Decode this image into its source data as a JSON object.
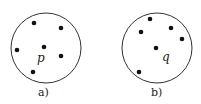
{
  "panels": [
    {
      "caption": "a)",
      "point_label": "p",
      "circle": {
        "cx": 46,
        "cy": 48,
        "r": 35
      },
      "points": [
        [
          34,
          23
        ],
        [
          61,
          28
        ],
        [
          17,
          50
        ],
        [
          44,
          47
        ],
        [
          61,
          56
        ],
        [
          33,
          72
        ]
      ],
      "label_pos": [
        37,
        62
      ]
    },
    {
      "caption": "b)",
      "point_label": "q",
      "circle": {
        "cx": 157,
        "cy": 48,
        "r": 35
      },
      "points": [
        [
          150,
          19
        ],
        [
          141,
          32
        ],
        [
          171,
          28
        ],
        [
          182,
          39
        ],
        [
          156,
          48
        ],
        [
          139,
          72
        ]
      ],
      "label_pos": [
        162,
        61
      ]
    }
  ],
  "colors": {
    "stroke": "#333333",
    "dot": "#111111"
  }
}
